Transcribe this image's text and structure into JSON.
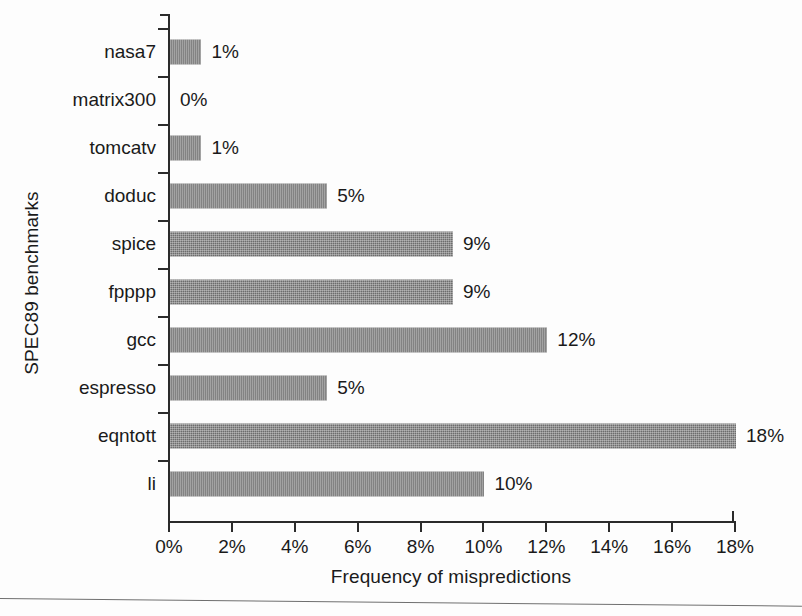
{
  "chart_data": {
    "type": "bar",
    "orientation": "horizontal",
    "title": "",
    "xlabel": "Frequency of mispredictions",
    "ylabel": "SPEC89 benchmarks",
    "xlim": [
      0,
      18
    ],
    "xtick_values": [
      0,
      2,
      4,
      6,
      8,
      10,
      12,
      14,
      16,
      18
    ],
    "xtick_labels": [
      "0%",
      "2%",
      "4%",
      "6%",
      "8%",
      "10%",
      "12%",
      "14%",
      "16%",
      "18%"
    ],
    "grid": false,
    "legend": false,
    "bar_color": "#6d6d6d",
    "axis_color": "#2b2b2b",
    "categories": [
      "nasa7",
      "matrix300",
      "tomcatv",
      "doduc",
      "spice",
      "fpppp",
      "gcc",
      "espresso",
      "eqntott",
      "li"
    ],
    "values": [
      1,
      0,
      1,
      5,
      9,
      9,
      12,
      5,
      18,
      10
    ],
    "value_labels": [
      "1%",
      "0%",
      "1%",
      "5%",
      "9%",
      "9%",
      "12%",
      "5%",
      "18%",
      "10%"
    ],
    "rows": [
      {
        "category": "nasa7",
        "value": 1,
        "value_label": "1%"
      },
      {
        "category": "matrix300",
        "value": 0,
        "value_label": "0%"
      },
      {
        "category": "tomcatv",
        "value": 1,
        "value_label": "1%"
      },
      {
        "category": "doduc",
        "value": 5,
        "value_label": "5%"
      },
      {
        "category": "spice",
        "value": 9,
        "value_label": "9%"
      },
      {
        "category": "fpppp",
        "value": 9,
        "value_label": "9%"
      },
      {
        "category": "gcc",
        "value": 12,
        "value_label": "12%"
      },
      {
        "category": "espresso",
        "value": 5,
        "value_label": "5%"
      },
      {
        "category": "eqntott",
        "value": 18,
        "value_label": "18%"
      },
      {
        "category": "li",
        "value": 10,
        "value_label": "10%"
      }
    ]
  }
}
